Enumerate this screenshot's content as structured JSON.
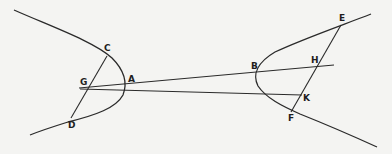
{
  "diagram": {
    "type": "geometric figure",
    "stroke_color": "#2a2a2a",
    "background_color": "#f4f4f2",
    "labels": {
      "C": "C",
      "G": "G",
      "A": "A",
      "D": "D",
      "B": "B",
      "H": "H",
      "K": "K",
      "E": "E",
      "F": "F"
    },
    "points": {
      "C": [
        107,
        56
      ],
      "G": [
        80,
        88
      ],
      "A": [
        124,
        86
      ],
      "D": [
        71,
        118
      ],
      "B": [
        256,
        73
      ],
      "H": [
        316,
        67
      ],
      "K": [
        302,
        95
      ],
      "E": [
        341,
        25
      ],
      "F": [
        291,
        111
      ]
    },
    "segments": [
      "C-D",
      "G-H",
      "G-K",
      "E-F"
    ],
    "curves": [
      "left-branch through C, A, D",
      "right-branch through E, B, F"
    ]
  }
}
